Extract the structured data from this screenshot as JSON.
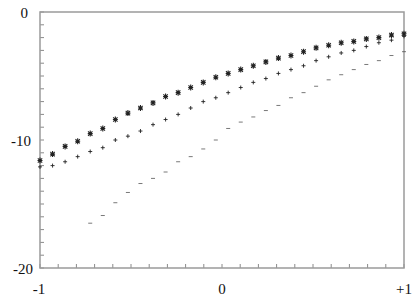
{
  "chart_data": {
    "type": "scatter",
    "title": "",
    "xlabel": "",
    "ylabel": "",
    "xlim": [
      -1,
      1
    ],
    "ylim": [
      -20,
      0
    ],
    "grid": false,
    "legend": null,
    "x_tick_labels": [
      {
        "value": -1,
        "label": "-1"
      },
      {
        "value": 0,
        "label": "0"
      },
      {
        "value": 1,
        "label": "+1"
      }
    ],
    "y_tick_labels": [
      {
        "value": 0,
        "label": "0"
      },
      {
        "value": -10,
        "label": "-10"
      },
      {
        "value": -20,
        "label": "-20"
      }
    ],
    "x_minor_tick_step": 0.1,
    "y_minor_tick_step": 1,
    "x": [
      -1.0,
      -0.931,
      -0.862,
      -0.793,
      -0.724,
      -0.655,
      -0.586,
      -0.517,
      -0.448,
      -0.379,
      -0.31,
      -0.241,
      -0.172,
      -0.103,
      -0.034,
      0.034,
      0.103,
      0.172,
      0.241,
      0.31,
      0.379,
      0.448,
      0.517,
      0.586,
      0.655,
      0.724,
      0.793,
      0.862,
      0.931,
      1.0
    ],
    "series": [
      {
        "name": "asterisk series",
        "marker": "*",
        "values": [
          -11.6,
          -11.1,
          -10.5,
          -10.1,
          -9.5,
          -9.1,
          -8.4,
          -7.9,
          -7.5,
          -7.1,
          -6.6,
          -6.3,
          -5.9,
          -5.5,
          -5.1,
          -4.8,
          -4.5,
          -4.2,
          -3.9,
          -3.6,
          -3.4,
          -3.1,
          -2.8,
          -2.6,
          -2.4,
          -2.3,
          -2.1,
          -2.0,
          -1.8,
          -1.7
        ]
      },
      {
        "name": "plus series",
        "marker": "+",
        "values": [
          -12.1,
          -12.0,
          -11.7,
          -11.3,
          -10.9,
          -10.6,
          -10.0,
          -9.7,
          -9.3,
          -8.8,
          -8.4,
          -8.0,
          -7.5,
          -7.0,
          -6.7,
          -6.3,
          -5.9,
          -5.5,
          -5.2,
          -4.8,
          -4.5,
          -4.2,
          -3.8,
          -3.5,
          -3.2,
          -3.0,
          -2.7,
          -2.4,
          -2.2,
          -1.9
        ]
      },
      {
        "name": "dash series",
        "marker": "-",
        "values": [
          null,
          null,
          null,
          null,
          -16.5,
          -15.9,
          -14.9,
          -14.1,
          -13.4,
          -13.0,
          -12.5,
          -11.7,
          -11.3,
          -10.7,
          -10.0,
          -9.1,
          -8.6,
          -8.2,
          -7.7,
          -7.3,
          -6.7,
          -6.3,
          -5.8,
          -5.3,
          -4.9,
          -4.5,
          -4.1,
          -3.8,
          -3.4,
          -3.1
        ]
      }
    ]
  },
  "style": {
    "axis_color": "#9a9a9a",
    "marker_color": "#222222",
    "background": "#ffffff"
  }
}
